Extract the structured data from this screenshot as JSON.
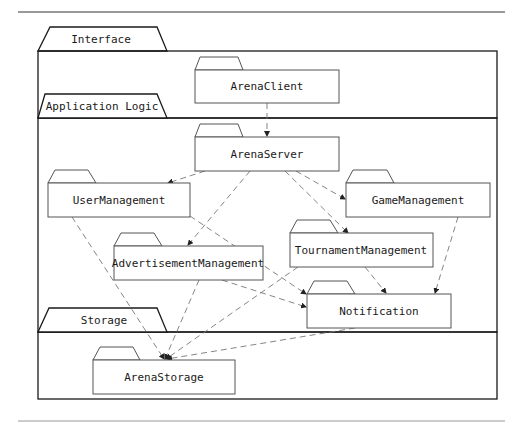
{
  "layers": [
    {
      "id": "interface",
      "label": "Interface"
    },
    {
      "id": "application-logic",
      "label": "Application Logic"
    },
    {
      "id": "storage",
      "label": "Storage"
    }
  ],
  "packages": [
    {
      "id": "arena-client",
      "label": "ArenaClient",
      "layer": "interface"
    },
    {
      "id": "arena-server",
      "label": "ArenaServer",
      "layer": "application-logic"
    },
    {
      "id": "user-management",
      "label": "UserManagement",
      "layer": "application-logic"
    },
    {
      "id": "game-management",
      "label": "GameManagement",
      "layer": "application-logic"
    },
    {
      "id": "advertisement-management",
      "label": "AdvertisementManagement",
      "layer": "application-logic"
    },
    {
      "id": "tournament-management",
      "label": "TournamentManagement",
      "layer": "application-logic"
    },
    {
      "id": "notification",
      "label": "Notification",
      "layer": "application-logic"
    },
    {
      "id": "arena-storage",
      "label": "ArenaStorage",
      "layer": "storage"
    }
  ],
  "dependencies": [
    {
      "from": "ArenaClient",
      "to": "ArenaServer"
    },
    {
      "from": "ArenaServer",
      "to": "UserManagement"
    },
    {
      "from": "ArenaServer",
      "to": "GameManagement"
    },
    {
      "from": "ArenaServer",
      "to": "AdvertisementManagement"
    },
    {
      "from": "ArenaServer",
      "to": "TournamentManagement"
    },
    {
      "from": "UserManagement",
      "to": "Notification"
    },
    {
      "from": "UserManagement",
      "to": "ArenaStorage"
    },
    {
      "from": "AdvertisementManagement",
      "to": "Notification"
    },
    {
      "from": "AdvertisementManagement",
      "to": "ArenaStorage"
    },
    {
      "from": "TournamentManagement",
      "to": "Notification"
    },
    {
      "from": "TournamentManagement",
      "to": "ArenaStorage"
    },
    {
      "from": "GameManagement",
      "to": "Notification"
    },
    {
      "from": "Notification",
      "to": "ArenaStorage"
    }
  ],
  "colors": {
    "frame": "#1a1a1a",
    "package": "#555555",
    "dependency": "#777777"
  }
}
